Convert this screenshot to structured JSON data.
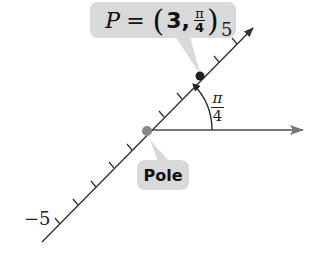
{
  "diagram": {
    "point_label": {
      "name": "P",
      "equals": "=",
      "r": "3",
      "theta_num": "π",
      "theta_den": "4",
      "open": "(",
      "close": ")",
      "comma": ","
    },
    "pole_label": "Pole",
    "angle_label": {
      "num": "π",
      "den": "4"
    },
    "axis_ticks": {
      "positive_end": "5",
      "negative_end": "−5"
    },
    "colors": {
      "line": "#333333",
      "polar_axis": "#777777",
      "callout": "#d9d9d9",
      "point": "#222222",
      "pole": "#888888"
    }
  }
}
